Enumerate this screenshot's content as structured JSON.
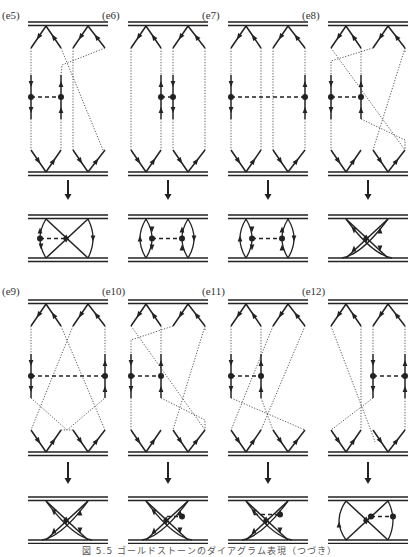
{
  "figure": {
    "caption": "図 5.5 ゴールドストーンのダイアグラム表現（つづき）",
    "caption_note": "caption partially cut off at bottom edge",
    "colors": {
      "ink": "#222222",
      "dotted": "#444444",
      "background": "#ffffff"
    }
  },
  "panels": [
    {
      "label": "(e5)",
      "row": 0,
      "col": 0,
      "type": "cross-right",
      "vertex_side": "left",
      "reduced": "x-left-vertex"
    },
    {
      "label": "(e6)",
      "row": 0,
      "col": 1,
      "type": "parallel",
      "vertex_side": "middle",
      "reduced": "two-bubbles-inner"
    },
    {
      "label": "(e7)",
      "row": 0,
      "col": 2,
      "type": "parallel",
      "vertex_side": "outer",
      "reduced": "two-bubbles-outer"
    },
    {
      "label": "(e8)",
      "row": 0,
      "col": 3,
      "type": "double-cross",
      "vertex_side": "left",
      "reduced": "double-x"
    },
    {
      "label": "(e9)",
      "row": 1,
      "col": 0,
      "type": "x-cross",
      "vertex_side": "outer",
      "reduced": "double-x"
    },
    {
      "label": "(e10)",
      "row": 1,
      "col": 1,
      "type": "double-cross",
      "vertex_side": "left",
      "reduced": "double-x-dash"
    },
    {
      "label": "(e11)",
      "row": 1,
      "col": 2,
      "type": "cross-left",
      "vertex_side": "left",
      "reduced": "double-x-dash-top"
    },
    {
      "label": "(e12)",
      "row": 1,
      "col": 3,
      "type": "cross-left-open",
      "vertex_side": "right",
      "reduced": "x-right-vertex"
    }
  ]
}
